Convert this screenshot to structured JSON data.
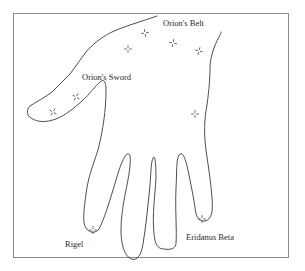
{
  "diagram": {
    "type": "hand-constellation-map",
    "labels": {
      "belt": "Orion's Belt",
      "sword": "Orion's Sword",
      "rigel": "Rigel",
      "eridanus": "Eridanus Beta"
    },
    "stars": [
      {
        "name": "belt-star-1",
        "x": 145,
        "y": 33
      },
      {
        "name": "belt-star-2",
        "x": 173,
        "y": 43
      },
      {
        "name": "belt-star-3",
        "x": 128,
        "y": 49
      },
      {
        "name": "belt-star-4",
        "x": 199,
        "y": 51
      },
      {
        "name": "sword-star-1",
        "x": 76,
        "y": 97
      },
      {
        "name": "sword-star-2",
        "x": 53,
        "y": 112
      },
      {
        "name": "side-star",
        "x": 195,
        "y": 114
      },
      {
        "name": "rigel-star",
        "x": 93,
        "y": 230
      },
      {
        "name": "eridanus-star",
        "x": 202,
        "y": 219
      }
    ],
    "colors": {
      "outline": "#3a3a3a",
      "frame": "#8a8a8a",
      "text": "#2a2a2a",
      "background": "#ffffff"
    }
  }
}
